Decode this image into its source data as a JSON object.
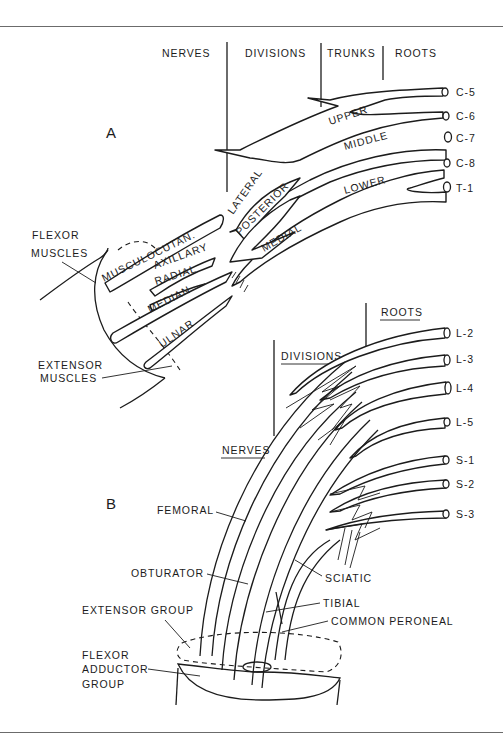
{
  "figure": {
    "panel_a": {
      "label": "A",
      "headers": [
        "NERVES",
        "DIVISIONS",
        "TRUNKS",
        "ROOTS"
      ],
      "roots": [
        "C-5",
        "C-6",
        "C-7",
        "C-8",
        "T-1"
      ],
      "trunks": [
        "UPPER",
        "MIDDLE",
        "LOWER"
      ],
      "cords": [
        "LATERAL",
        "POSTERIOR",
        "MEDIAL"
      ],
      "nerves": [
        "MUSCULOCUTAN.",
        "AXILLARY",
        "RADIAL",
        "MEDIAN",
        "ULNAR"
      ],
      "muscle_labels": {
        "flexor_line1": "FLEXOR",
        "flexor_line2": "MUSCLES",
        "extensor_line1": "EXTENSOR",
        "extensor_line2": "MUSCLES"
      }
    },
    "panel_b": {
      "label": "B",
      "headers": [
        "ROOTS",
        "DIVISIONS",
        "NERVES"
      ],
      "roots": [
        "L-2",
        "L-3",
        "L-4",
        "L-5",
        "S-1",
        "S-2",
        "S-3"
      ],
      "nerves": [
        "FEMORAL",
        "OBTURATOR",
        "SCIATIC",
        "TIBIAL",
        "COMMON PERONEAL"
      ],
      "muscle_labels": {
        "extensor_group": "EXTENSOR GROUP",
        "flexor_line1": "FLEXOR",
        "flexor_line2": "ADDUCTOR",
        "flexor_line3": "GROUP"
      }
    }
  }
}
